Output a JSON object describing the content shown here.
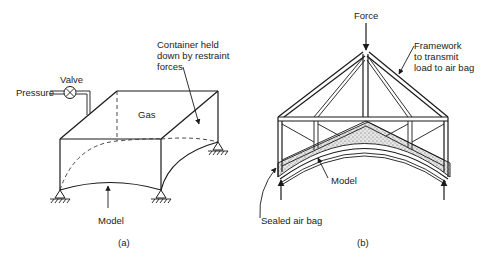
{
  "figure_a": {
    "caption": "(a)",
    "labels": {
      "pressure": "Pressure",
      "valve": "Valve",
      "gas": "Gas",
      "container_line1": "Container held",
      "container_line2": "down by restraint",
      "container_line3": "forces",
      "model": "Model"
    }
  },
  "figure_b": {
    "caption": "(b)",
    "labels": {
      "force": "Force",
      "framework_line1": "Framework",
      "framework_line2": "to transmit",
      "framework_line3": "load to air bag",
      "model": "Model",
      "air_bag": "Sealed air bag"
    }
  }
}
